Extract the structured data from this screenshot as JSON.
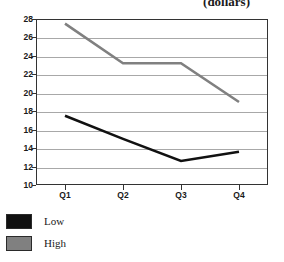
{
  "chart_data": {
    "type": "line",
    "title": "(dollars)",
    "xlabel": "",
    "ylabel": "",
    "categories": [
      "Q1",
      "Q2",
      "Q3",
      "Q4"
    ],
    "series": [
      {
        "name": "Low",
        "color": "#111111",
        "values": [
          17.5,
          15.0,
          12.6,
          13.6
        ]
      },
      {
        "name": "High",
        "color": "#808080",
        "values": [
          27.5,
          23.2,
          23.2,
          19.0
        ]
      }
    ],
    "ylim": [
      10,
      28
    ],
    "yticks": [
      10,
      12,
      14,
      16,
      18,
      20,
      22,
      24,
      26,
      28
    ],
    "ytick_labels": [
      "10",
      "12",
      "14",
      "16",
      "18",
      "20",
      "22",
      "24",
      "26",
      "28"
    ],
    "grid": true,
    "grid_axis": "y",
    "legend_position": "bottom-left",
    "frame_color": "#333333",
    "gridline_color": "#a8a8a8",
    "background": "#ffffff"
  },
  "legend": {
    "items": [
      {
        "label": "Low",
        "color": "#111111"
      },
      {
        "label": "High",
        "color": "#808080"
      }
    ]
  }
}
